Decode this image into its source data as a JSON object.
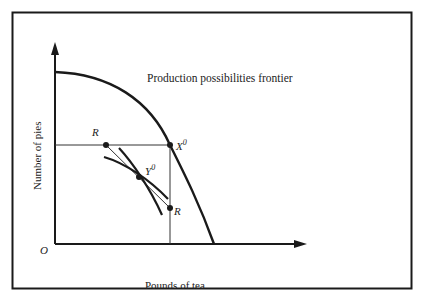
{
  "diagram": {
    "title": "Production possibilities frontier",
    "x_axis_label": "Pounds of tea",
    "y_axis_label": "Number of pies",
    "origin_label": "O",
    "points": {
      "x0": {
        "label": "X",
        "sup": "0"
      },
      "y0": {
        "label": "Y",
        "sup": "0"
      },
      "r_top": {
        "label": "R"
      },
      "r_bottom": {
        "label": "R"
      }
    },
    "colors": {
      "ink": "#1a1a1a",
      "background": "#ffffff"
    }
  }
}
